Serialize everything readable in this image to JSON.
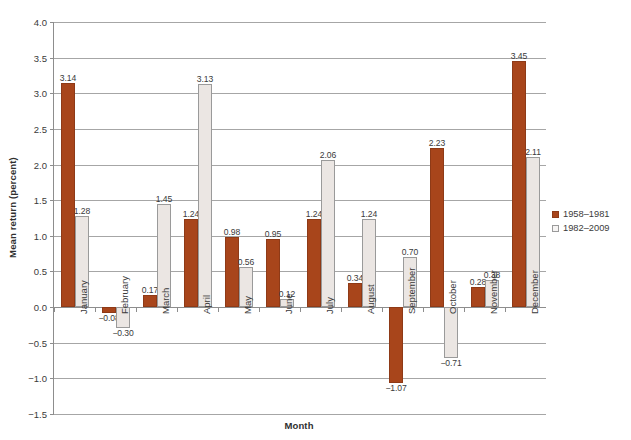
{
  "chart_data": {
    "type": "bar",
    "title": "",
    "xlabel": "Month",
    "ylabel": "Mean return (percent)",
    "ylim": [
      -1.5,
      4.0
    ],
    "ytick_step": 0.5,
    "yticks": [
      "4.0",
      "3.5",
      "3.0",
      "2.5",
      "2.0",
      "1.5",
      "1.0",
      "0.5",
      "0.0",
      "-0.5",
      "-1.0",
      "-1.5"
    ],
    "ytick_values": [
      4.0,
      3.5,
      3.0,
      2.5,
      2.0,
      1.5,
      1.0,
      0.5,
      0.0,
      -0.5,
      -1.0,
      -1.5
    ],
    "grid": true,
    "legend_position": "right",
    "categories": [
      "January",
      "February",
      "March",
      "April",
      "May",
      "June",
      "July",
      "August",
      "September",
      "October",
      "November",
      "December"
    ],
    "series": [
      {
        "name": "1958–1981",
        "color": "#a8451b",
        "values": [
          3.14,
          -0.08,
          0.17,
          1.24,
          0.98,
          0.95,
          1.24,
          0.34,
          -1.07,
          2.23,
          0.28,
          3.45
        ],
        "labels": [
          "3.14",
          "−0.08",
          "0.17",
          "1.24",
          "0.98",
          "0.95",
          "1.24",
          "0.34",
          "−1.07",
          "2.23",
          "0.28",
          "3.45"
        ]
      },
      {
        "name": "1982–2009",
        "color": "#ebe6e3",
        "values": [
          1.28,
          -0.3,
          1.45,
          3.13,
          0.56,
          0.12,
          2.06,
          1.24,
          0.7,
          -0.71,
          0.38,
          2.11
        ],
        "labels": [
          "1.28",
          "−0.30",
          "1.45",
          "3.13",
          "0.56",
          "0.12",
          "2.06",
          "1.24",
          "0.70",
          "−0.71",
          "0.38",
          "2.11"
        ]
      }
    ]
  },
  "colors": {
    "series_1958_1981": "#a8451b",
    "series_1982_2009": "#ebe6e3",
    "gridline": "#a6a6a6",
    "axis": "#8d8d8d",
    "text": "#3a3a3a"
  }
}
